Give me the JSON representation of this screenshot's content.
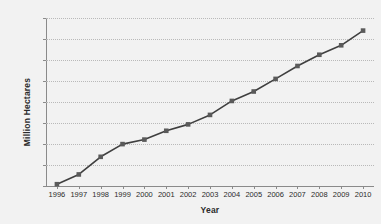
{
  "chart_data": {
    "type": "line",
    "title": "",
    "xlabel": "Year",
    "ylabel": "Million Hectares",
    "categories": [
      "1996",
      "1997",
      "1998",
      "1999",
      "2000",
      "2001",
      "2002",
      "2003",
      "2004",
      "2005",
      "2006",
      "2007",
      "2008",
      "2009",
      "2010"
    ],
    "values": [
      1.7,
      11,
      27.8,
      39.9,
      44.2,
      52.6,
      58.7,
      67.7,
      81,
      90,
      102,
      114.3,
      125,
      134,
      148
    ],
    "series": [
      {
        "name": "Million Hectares",
        "values": [
          1.7,
          11,
          27.8,
          39.9,
          44.2,
          52.6,
          58.7,
          67.7,
          81,
          90,
          102,
          114.3,
          125,
          134,
          148
        ]
      }
    ],
    "ylim": [
      0,
      160
    ],
    "y_ticks": [
      0,
      20,
      40,
      60,
      80,
      100,
      120,
      140,
      160
    ],
    "y_tick_labels": [
      "0",
      "20",
      "40",
      "60",
      "80",
      "100",
      "120",
      "140",
      "160"
    ],
    "x_tick_labels": [
      "1996",
      "1997",
      "1998",
      "1999",
      "2000",
      "2001",
      "2002",
      "2003",
      "2004",
      "2005",
      "2006",
      "2007",
      "2008",
      "2009",
      "2010"
    ],
    "grid": true,
    "grid_axis": "y",
    "legend": false,
    "legend_position": "none",
    "marker": "square",
    "line_color": "#3f3f3f",
    "marker_color": "#5a5a5a",
    "grid_color": "#b9b9b9",
    "axis_color": "#8a8a8a",
    "background_color": "#f2f2f2",
    "text_color": "#2b2b2b"
  }
}
